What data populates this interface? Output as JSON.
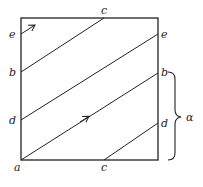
{
  "diagram": {
    "type": "torus-square-winding",
    "square": {
      "x0": 21,
      "y0": 18,
      "x1": 158,
      "y1": 160
    },
    "labels": {
      "left_e": "e",
      "left_b": "b",
      "left_d": "d",
      "corner_a": "a",
      "top_c": "c",
      "bottom_c": "c",
      "right_e": "e",
      "right_b": "b",
      "right_d": "d",
      "brace": "α"
    },
    "segments": [
      {
        "from": "b(left)",
        "to": "c(top)"
      },
      {
        "from": "d(left)",
        "to": "e(right)"
      },
      {
        "from": "a",
        "to": "b(right)"
      },
      {
        "from": "c(bottom)",
        "to": "d(right)"
      },
      {
        "from": "e(left)",
        "to": "arrow-start"
      }
    ],
    "colors": {
      "ink": "#222222",
      "background": "#ffffff"
    }
  }
}
